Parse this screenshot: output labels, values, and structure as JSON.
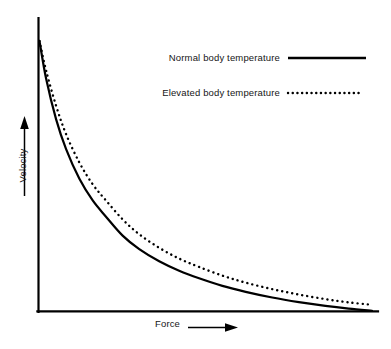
{
  "chart_data": {
    "type": "line",
    "title": "",
    "xlabel": "Force",
    "ylabel": "Velocity",
    "grid": false,
    "legend_position": "top-right",
    "xlim": [
      0,
      100
    ],
    "ylim": [
      0,
      100
    ],
    "axis_ticks": false,
    "series": [
      {
        "name": "Normal body temperature",
        "style": "solid",
        "color": "#000000",
        "x": [
          0,
          2,
          5,
          8,
          12,
          16,
          20,
          25,
          30,
          36,
          42,
          48,
          55,
          62,
          70,
          78,
          86,
          93,
          100
        ],
        "y": [
          100,
          86,
          71,
          60,
          49,
          41,
          35,
          28,
          23,
          18.5,
          15,
          12.2,
          9.4,
          7.2,
          5.1,
          3.4,
          2.0,
          1.0,
          0.2
        ]
      },
      {
        "name": "Elevated body temperature",
        "style": "dotted",
        "color": "#000000",
        "x": [
          0,
          2,
          5,
          8,
          12,
          16,
          20,
          25,
          30,
          36,
          42,
          48,
          55,
          62,
          70,
          78,
          86,
          93,
          100
        ],
        "y": [
          100,
          89,
          76,
          65.5,
          55,
          47,
          41,
          34,
          28.5,
          23.5,
          19.5,
          16.4,
          13.2,
          10.6,
          8.2,
          6.2,
          4.5,
          3.3,
          2.4
        ]
      }
    ]
  },
  "legend": {
    "normal": {
      "label": "Normal body temperature",
      "style": "solid"
    },
    "elevated": {
      "label": "Elevated body temperature",
      "style": "dotted"
    }
  },
  "axes": {
    "x_label": "Force",
    "y_label": "Velocity",
    "x_arrow": "arrow-right",
    "y_arrow": "arrow-up"
  },
  "colors": {
    "line": "#000000",
    "axis": "#000000",
    "background": "#ffffff",
    "text": "#161616"
  }
}
